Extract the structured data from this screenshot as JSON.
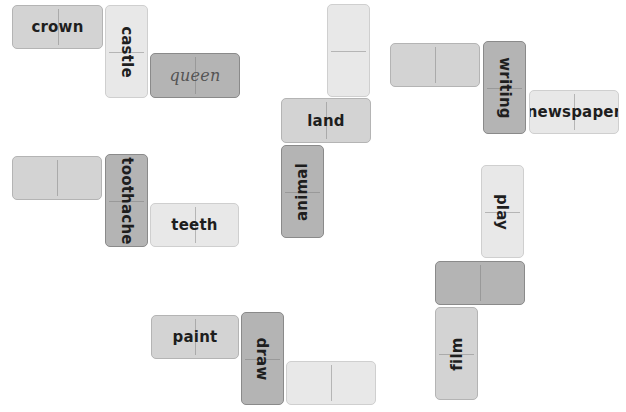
{
  "puzzle": {
    "type": "word-association-dominoes",
    "groups": [
      {
        "id": "group-1",
        "tiles": [
          {
            "word": "crown",
            "orientation": "horizontal",
            "shade": "mid"
          },
          {
            "word": "castle",
            "orientation": "vertical-cw",
            "shade": "light"
          },
          {
            "word": "queen",
            "orientation": "horizontal",
            "shade": "dark",
            "style": "handwritten"
          }
        ]
      },
      {
        "id": "group-2",
        "tiles": [
          {
            "word": "",
            "orientation": "vertical",
            "shade": "light"
          },
          {
            "word": "land",
            "orientation": "horizontal",
            "shade": "mid"
          },
          {
            "word": "animal",
            "orientation": "vertical-ccw",
            "shade": "dark"
          }
        ]
      },
      {
        "id": "group-3",
        "tiles": [
          {
            "word": "",
            "orientation": "horizontal",
            "shade": "mid"
          },
          {
            "word": "writing",
            "orientation": "vertical-cw",
            "shade": "dark"
          },
          {
            "word": "newspaper",
            "orientation": "horizontal",
            "shade": "light"
          }
        ]
      },
      {
        "id": "group-4",
        "tiles": [
          {
            "word": "",
            "orientation": "horizontal",
            "shade": "mid"
          },
          {
            "word": "toothache",
            "orientation": "vertical-cw",
            "shade": "dark"
          },
          {
            "word": "teeth",
            "orientation": "horizontal",
            "shade": "light"
          }
        ]
      },
      {
        "id": "group-5",
        "tiles": [
          {
            "word": "play",
            "orientation": "vertical-cw",
            "shade": "light"
          },
          {
            "word": "",
            "orientation": "horizontal",
            "shade": "dark"
          },
          {
            "word": "film",
            "orientation": "vertical-ccw",
            "shade": "mid"
          }
        ]
      },
      {
        "id": "group-6",
        "tiles": [
          {
            "word": "paint",
            "orientation": "horizontal",
            "shade": "mid"
          },
          {
            "word": "draw",
            "orientation": "vertical-cw",
            "shade": "dark"
          },
          {
            "word": "",
            "orientation": "horizontal",
            "shade": "light"
          }
        ]
      }
    ]
  },
  "colors": {
    "background": "#ffffff",
    "tile_light": "#e8e8e8",
    "tile_mid": "#d3d3d3",
    "tile_dark": "#b4b4b4",
    "text": "#1e1e1e"
  }
}
